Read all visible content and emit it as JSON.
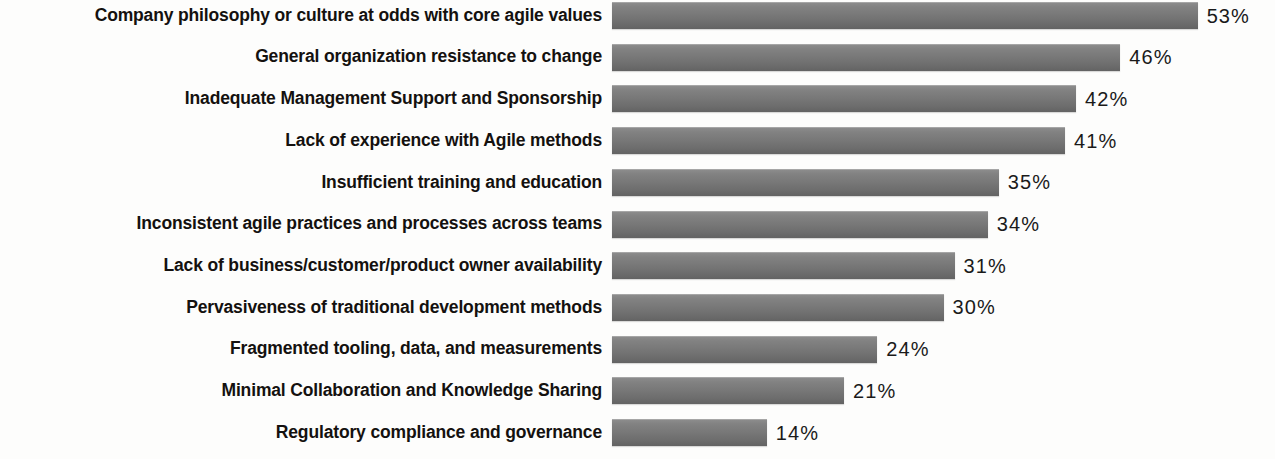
{
  "chart_data": {
    "type": "bar",
    "orientation": "horizontal",
    "title": "",
    "subtitle": "",
    "xlabel": "",
    "ylabel": "",
    "grid": false,
    "legend": null,
    "axis_visible": false,
    "value_suffix": "%",
    "xlim": [
      0,
      60
    ],
    "categories": [
      "Company philosophy or culture at odds with core agile values",
      "General organization resistance to change",
      "Inadequate Management Support and Sponsorship",
      "Lack of experience with Agile methods",
      "Insufficient training and education",
      "Inconsistent agile practices and processes across teams",
      "Lack of business/customer/product owner availability",
      "Pervasiveness of traditional development methods",
      "Fragmented tooling, data, and measurements",
      "Minimal Collaboration and Knowledge Sharing",
      "Regulatory compliance and governance"
    ],
    "values": [
      53,
      46,
      42,
      41,
      35,
      34,
      31,
      30,
      24,
      21,
      14
    ],
    "value_labels": [
      "53%",
      "46%",
      "42%",
      "41%",
      "35%",
      "34%",
      "31%",
      "30%",
      "24%",
      "21%",
      "14%"
    ],
    "colors": {
      "bar_top": "#8e8e8e",
      "bar_bottom": "#636363",
      "background": "#fdfdfc",
      "label_text": "#14110f",
      "value_text": "#1a1a1a"
    }
  }
}
